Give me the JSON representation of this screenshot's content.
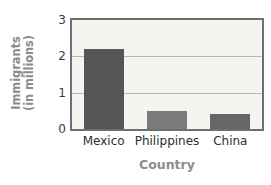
{
  "chart_data": {
    "type": "bar",
    "title": "",
    "xlabel": "Country",
    "ylabel_line1": "Immigrants",
    "ylabel_line2": "(in millions)",
    "ylabel": "Immigrants (in millions)",
    "categories": [
      "Mexico",
      "Philippines",
      "China"
    ],
    "values": [
      2.2,
      0.5,
      0.42
    ],
    "ylim": [
      0,
      3
    ],
    "yticks": [
      0,
      1,
      2,
      3
    ],
    "ytick_labels": [
      "0",
      "1",
      "2",
      "3"
    ],
    "grid": "horizontal",
    "legend": "none",
    "bar_colors": [
      "#555555",
      "#7a7a7a",
      "#666666"
    ],
    "plot_background": "#f4f4f1",
    "plot_border_color": "#6f6f6f",
    "gridline_color": "#b9b9b4",
    "axis_title_color": "#8c8c8c",
    "tick_label_color": "#2e2e2e"
  }
}
